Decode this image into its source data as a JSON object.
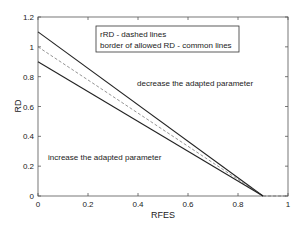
{
  "chart_data": {
    "type": "line",
    "title": "",
    "xlabel": "RFES",
    "ylabel": "RD",
    "xlim": [
      0,
      1
    ],
    "ylim": [
      0,
      1.2
    ],
    "xticks": [
      "0",
      "0.2",
      "0.4",
      "0.6",
      "0.8",
      "1"
    ],
    "yticks": [
      "0",
      "0.2",
      "0.4",
      "0.6",
      "0.8",
      "1",
      "1.2"
    ],
    "grid": false,
    "series": [
      {
        "name": "upper border of allowed RD",
        "style": "solid",
        "x": [
          0,
          0.9
        ],
        "y": [
          1.1,
          0
        ]
      },
      {
        "name": "rRD",
        "style": "dashed",
        "x": [
          0,
          0.9,
          1.0
        ],
        "y": [
          1.0,
          0,
          0
        ]
      },
      {
        "name": "lower border of allowed RD",
        "style": "solid",
        "x": [
          0,
          0.9
        ],
        "y": [
          0.9,
          0
        ]
      }
    ],
    "legend": {
      "lines": [
        "rRD - dashed lines",
        "border of allowed RD - common lines"
      ],
      "position": "top"
    },
    "annotations": [
      {
        "text": "decrease the adapted parameter",
        "x": 0.45,
        "y": 0.8
      },
      {
        "text": "increase the adapted parameter",
        "x": 0.04,
        "y": 0.26
      }
    ]
  }
}
